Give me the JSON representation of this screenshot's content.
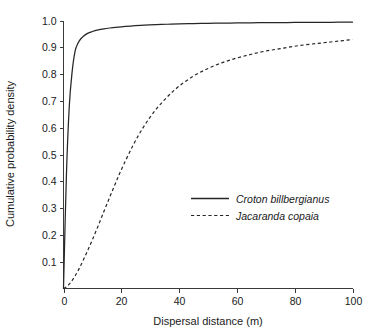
{
  "chart_data": {
    "type": "line",
    "title": "",
    "xlabel": "Dispersal distance (m)",
    "ylabel": "Cumulative probability density",
    "xlim": [
      0,
      100
    ],
    "ylim": [
      0,
      1.0
    ],
    "grid": false,
    "legend_position": "inside-center-right",
    "xticks": [
      "0",
      "20",
      "40",
      "60",
      "80",
      "100"
    ],
    "xtick_values": [
      0,
      20,
      40,
      60,
      80,
      100
    ],
    "yticks": [
      "0.1",
      "0.2",
      "0.3",
      "0.4",
      "0.5",
      "0.6",
      "0.7",
      "0.8",
      "0.9",
      "1.0"
    ],
    "ytick_values": [
      0.1,
      0.2,
      0.3,
      0.4,
      0.5,
      0.6,
      0.7,
      0.8,
      0.9,
      1.0
    ],
    "x": [
      0,
      1,
      2,
      3,
      4,
      5,
      6,
      8,
      10,
      12,
      14,
      16,
      18,
      20,
      24,
      28,
      32,
      36,
      40,
      45,
      50,
      55,
      60,
      65,
      70,
      75,
      80,
      85,
      90,
      95,
      100
    ],
    "series": [
      {
        "name": "Croton billbergianus",
        "style": "solid",
        "color": "#262626",
        "values": [
          0.0,
          0.42,
          0.68,
          0.81,
          0.885,
          0.915,
          0.932,
          0.95,
          0.959,
          0.965,
          0.969,
          0.972,
          0.9745,
          0.9765,
          0.98,
          0.9825,
          0.9845,
          0.986,
          0.9872,
          0.9884,
          0.9894,
          0.9902,
          0.9908,
          0.9914,
          0.9919,
          0.9923,
          0.9927,
          0.993,
          0.9933,
          0.9936,
          0.9938
        ]
      },
      {
        "name": "Jacaranda copaia",
        "style": "dashed",
        "color": "#262626",
        "values": [
          0.0,
          0.006,
          0.016,
          0.03,
          0.047,
          0.066,
          0.087,
          0.133,
          0.182,
          0.234,
          0.288,
          0.341,
          0.393,
          0.443,
          0.533,
          0.608,
          0.668,
          0.716,
          0.755,
          0.793,
          0.821,
          0.843,
          0.86,
          0.874,
          0.886,
          0.895,
          0.904,
          0.911,
          0.917,
          0.923,
          0.929
        ]
      }
    ],
    "legend_entries": [
      {
        "label": "Croton billbergianus",
        "style": "solid"
      },
      {
        "label": "Jacaranda copaia",
        "style": "dashed"
      }
    ]
  }
}
